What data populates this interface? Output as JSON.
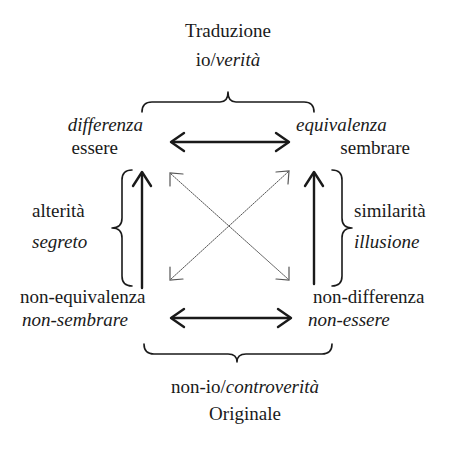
{
  "top": {
    "title": "Traduzione",
    "subtitle_prefix": "io/",
    "subtitle_italic": "verità"
  },
  "bottom": {
    "subtitle_prefix": "non-io/",
    "subtitle_italic": "controverità",
    "title": "Originale"
  },
  "corners": {
    "top_left": {
      "line1": "differenza",
      "line2": "essere"
    },
    "top_right": {
      "line1": "equivalenza",
      "line2": "sembrare"
    },
    "bottom_left": {
      "line1": "non-equivalenza",
      "line2": "non-sembrare"
    },
    "bottom_right": {
      "line1": "non-differenza",
      "line2": "non-essere"
    }
  },
  "sides": {
    "left": {
      "line1": "alterità",
      "line2": "segreto"
    },
    "right": {
      "line1": "similarità",
      "line2": "illusione"
    }
  },
  "colors": {
    "ink": "#1a1a1a",
    "dotted": "#555555"
  }
}
